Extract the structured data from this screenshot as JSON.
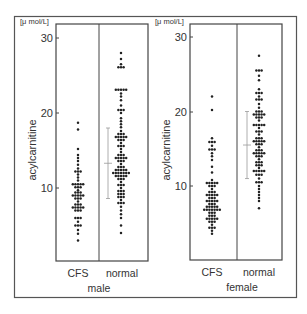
{
  "chart_data": [
    {
      "type": "scatter",
      "subtype": "dot-plot",
      "panel": "male",
      "group_label": "male",
      "unit_label": "[μ mol/L]",
      "ylabel": "acylcarnitine",
      "yticks": [
        10,
        20,
        30
      ],
      "ylim": [
        0,
        32
      ],
      "categories": [
        "CFS",
        "normal"
      ],
      "series": [
        {
          "name": "CFS",
          "rows": [
            [
              18.7,
              1
            ],
            [
              17.8,
              1
            ],
            [
              15.2,
              1
            ],
            [
              14.4,
              1
            ],
            [
              14.0,
              1
            ],
            [
              13.6,
              1
            ],
            [
              13.1,
              1
            ],
            [
              12.6,
              1
            ],
            [
              12.2,
              3
            ],
            [
              11.8,
              1
            ],
            [
              11.4,
              1
            ],
            [
              11.0,
              1
            ],
            [
              10.5,
              5
            ],
            [
              10.1,
              3
            ],
            [
              9.7,
              1
            ],
            [
              9.4,
              3
            ],
            [
              9.0,
              5
            ],
            [
              8.6,
              3
            ],
            [
              8.2,
              1
            ],
            [
              7.8,
              3
            ],
            [
              7.4,
              5
            ],
            [
              7.0,
              3
            ],
            [
              6.0,
              3
            ],
            [
              5.5,
              1
            ],
            [
              5.0,
              3
            ],
            [
              4.4,
              1
            ],
            [
              3.9,
              1
            ],
            [
              3.0,
              1
            ]
          ]
        },
        {
          "name": "normal",
          "rows": [
            [
              28.0,
              1
            ],
            [
              27.2,
              1
            ],
            [
              26.5,
              1
            ],
            [
              26.1,
              3
            ],
            [
              23.1,
              5
            ],
            [
              22.6,
              1
            ],
            [
              22.2,
              1
            ],
            [
              21.7,
              1
            ],
            [
              21.0,
              1
            ],
            [
              20.4,
              3
            ],
            [
              20.0,
              1
            ],
            [
              19.3,
              1
            ],
            [
              18.9,
              1
            ],
            [
              18.5,
              1
            ],
            [
              18.1,
              1
            ],
            [
              17.6,
              1
            ],
            [
              17.2,
              3
            ],
            [
              16.8,
              5
            ],
            [
              16.4,
              3
            ],
            [
              16.0,
              1
            ],
            [
              15.6,
              3
            ],
            [
              15.2,
              1
            ],
            [
              14.8,
              1
            ],
            [
              14.4,
              3
            ],
            [
              14.0,
              5
            ],
            [
              13.6,
              3
            ],
            [
              13.2,
              1
            ],
            [
              12.8,
              3
            ],
            [
              12.4,
              5
            ],
            [
              12.0,
              7
            ],
            [
              11.6,
              5
            ],
            [
              11.2,
              3
            ],
            [
              10.8,
              1
            ],
            [
              10.4,
              3
            ],
            [
              10.0,
              1
            ],
            [
              9.6,
              3
            ],
            [
              9.2,
              3
            ],
            [
              8.8,
              3
            ],
            [
              8.4,
              1
            ],
            [
              8.0,
              3
            ],
            [
              7.5,
              1
            ],
            [
              7.0,
              1
            ],
            [
              6.5,
              1
            ],
            [
              6.0,
              1
            ],
            [
              5.0,
              1
            ],
            [
              4.0,
              1
            ]
          ]
        }
      ],
      "mean_sd": {
        "category": "normal",
        "mean": 13.3,
        "upper": 18.0,
        "lower": 8.6
      }
    },
    {
      "type": "scatter",
      "subtype": "dot-plot",
      "panel": "female",
      "group_label": "female",
      "unit_label": "[μ mol/L]",
      "ylabel": "acylcarnitine",
      "yticks": [
        10,
        20,
        30
      ],
      "ylim": [
        0,
        32
      ],
      "categories": [
        "CFS",
        "normal"
      ],
      "series": [
        {
          "name": "CFS",
          "rows": [
            [
              22.0,
              1
            ],
            [
              20.2,
              1
            ],
            [
              16.4,
              1
            ],
            [
              15.9,
              3
            ],
            [
              15.4,
              1
            ],
            [
              14.9,
              3
            ],
            [
              14.4,
              1
            ],
            [
              14.0,
              1
            ],
            [
              13.5,
              1
            ],
            [
              12.6,
              1
            ],
            [
              11.8,
              1
            ],
            [
              10.8,
              1
            ],
            [
              10.4,
              5
            ],
            [
              10.0,
              3
            ],
            [
              9.6,
              1
            ],
            [
              9.2,
              3
            ],
            [
              8.8,
              5
            ],
            [
              8.4,
              3
            ],
            [
              8.0,
              5
            ],
            [
              7.6,
              3
            ],
            [
              7.2,
              5
            ],
            [
              6.8,
              7
            ],
            [
              6.4,
              3
            ],
            [
              6.0,
              3
            ],
            [
              5.6,
              5
            ],
            [
              5.2,
              3
            ],
            [
              4.8,
              1
            ],
            [
              4.4,
              3
            ],
            [
              4.0,
              1
            ],
            [
              3.6,
              1
            ]
          ]
        },
        {
          "name": "normal",
          "rows": [
            [
              27.5,
              1
            ],
            [
              25.5,
              3
            ],
            [
              24.8,
              1
            ],
            [
              24.2,
              1
            ],
            [
              23.0,
              1
            ],
            [
              22.5,
              3
            ],
            [
              22.0,
              1
            ],
            [
              21.6,
              3
            ],
            [
              21.0,
              1
            ],
            [
              20.5,
              1
            ],
            [
              20.0,
              3
            ],
            [
              19.6,
              5
            ],
            [
              19.2,
              3
            ],
            [
              18.8,
              1
            ],
            [
              18.2,
              5
            ],
            [
              17.8,
              1
            ],
            [
              17.3,
              3
            ],
            [
              16.9,
              1
            ],
            [
              16.4,
              3
            ],
            [
              16.0,
              5
            ],
            [
              15.6,
              3
            ],
            [
              15.2,
              1
            ],
            [
              14.8,
              3
            ],
            [
              14.4,
              5
            ],
            [
              14.0,
              3
            ],
            [
              13.6,
              1
            ],
            [
              13.2,
              3
            ],
            [
              12.8,
              3
            ],
            [
              12.4,
              1
            ],
            [
              12.0,
              5
            ],
            [
              11.5,
              3
            ],
            [
              11.0,
              1
            ],
            [
              10.5,
              3
            ],
            [
              10.0,
              1
            ],
            [
              9.6,
              1
            ],
            [
              9.2,
              1
            ],
            [
              8.8,
              1
            ],
            [
              8.4,
              1
            ],
            [
              8.0,
              1
            ],
            [
              7.0,
              1
            ]
          ]
        }
      ],
      "mean_sd": {
        "category": "normal",
        "mean": 15.5,
        "upper": 20.0,
        "lower": 11.0
      }
    }
  ],
  "panels": {
    "male": {
      "unit_label": "[μ mol/L]",
      "ylabel": "acylcarnitine",
      "ticks": [
        "30",
        "20",
        "10"
      ],
      "cat_cfs": "CFS",
      "cat_normal": "normal",
      "group": "male"
    },
    "female": {
      "unit_label": "[μ mol/L]",
      "ylabel": "acylcarnitine",
      "ticks": [
        "30",
        "20",
        "10"
      ],
      "cat_cfs": "CFS",
      "cat_normal": "normal",
      "group": "female"
    }
  },
  "colors": {
    "frame": "#555555",
    "dots": "#222222",
    "sd_bar": "#999999",
    "text": "#333333"
  }
}
